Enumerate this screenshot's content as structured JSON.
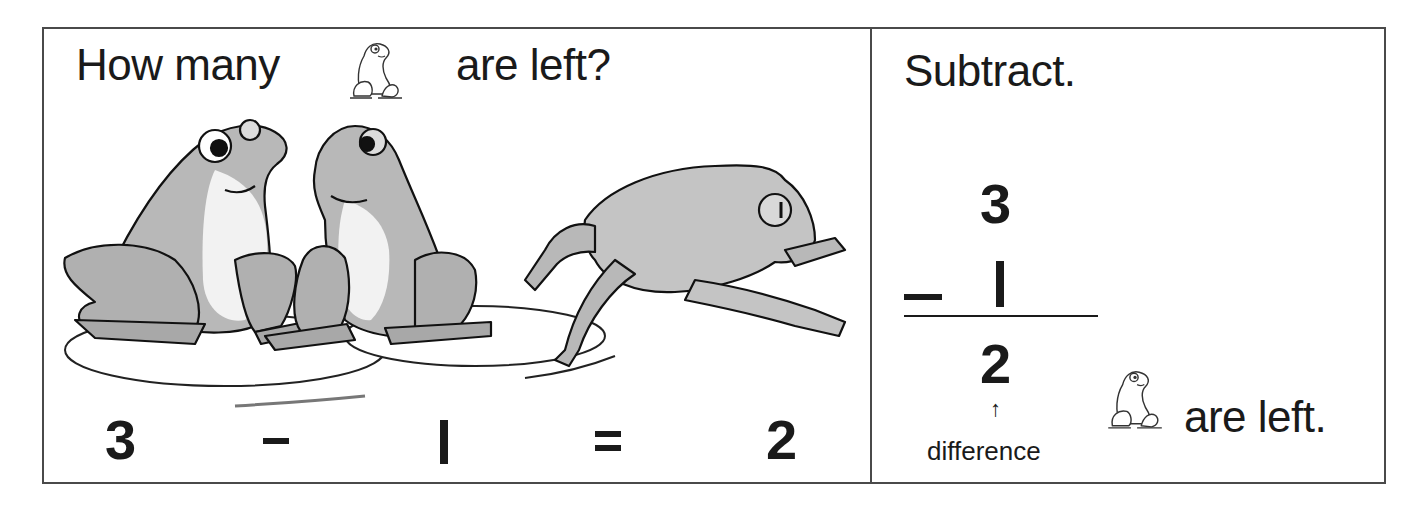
{
  "left_panel": {
    "question_part1": "How many",
    "question_icon": "frog-icon",
    "question_part2": "are left?",
    "illustration": {
      "description": "Two frogs sitting on lily pads and one frog jumping away",
      "frogs_total": 3,
      "frogs_leaving": 1
    },
    "equation": {
      "minuend": "3",
      "operator": "−",
      "subtrahend": "1",
      "equals": "=",
      "result": "2"
    }
  },
  "right_panel": {
    "title": "Subtract.",
    "vertical": {
      "top": "3",
      "operator": "−",
      "subtrahend": "1",
      "result": "2"
    },
    "arrow": "↑",
    "result_label": "difference",
    "answer_icon": "frog-icon",
    "answer_text": "are left."
  },
  "colors": {
    "ink": "#1a1a1a",
    "border": "#4a4a4a",
    "frog_fill": "#bdbdbd",
    "frog_light": "#e6e6e6"
  }
}
